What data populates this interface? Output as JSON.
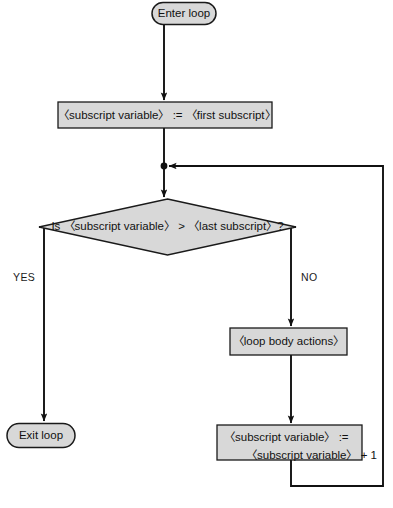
{
  "diagram": {
    "type": "flowchart",
    "colors": {
      "node_fill": "#d8d8d8",
      "node_stroke": "#1a1a1a",
      "connector": "#111111",
      "background": "#ffffff",
      "text": "#111111"
    },
    "nodes": [
      {
        "id": "enter",
        "shape": "terminator",
        "label": "Enter loop"
      },
      {
        "id": "init",
        "shape": "process",
        "label": "〈subscript variable〉 := 〈first subscript〉"
      },
      {
        "id": "test",
        "shape": "decision",
        "label": "Is 〈subscript variable〉 > 〈last subscript〉?"
      },
      {
        "id": "body",
        "shape": "process",
        "label": "〈loop body actions〉"
      },
      {
        "id": "increment",
        "shape": "process",
        "label_line1": "〈subscript variable〉 :=",
        "label_line2": "〈subscript variable〉  + 1"
      },
      {
        "id": "exit",
        "shape": "terminator",
        "label": "Exit loop"
      }
    ],
    "branch_labels": {
      "yes": "YES",
      "no": "NO"
    },
    "edges": [
      {
        "from": "enter",
        "to": "init",
        "label": ""
      },
      {
        "from": "init",
        "to": "test",
        "label": ""
      },
      {
        "from": "test",
        "to": "exit",
        "label": "YES"
      },
      {
        "from": "test",
        "to": "body",
        "label": "NO"
      },
      {
        "from": "body",
        "to": "increment",
        "label": ""
      },
      {
        "from": "increment",
        "to": "test",
        "label": ""
      }
    ]
  }
}
